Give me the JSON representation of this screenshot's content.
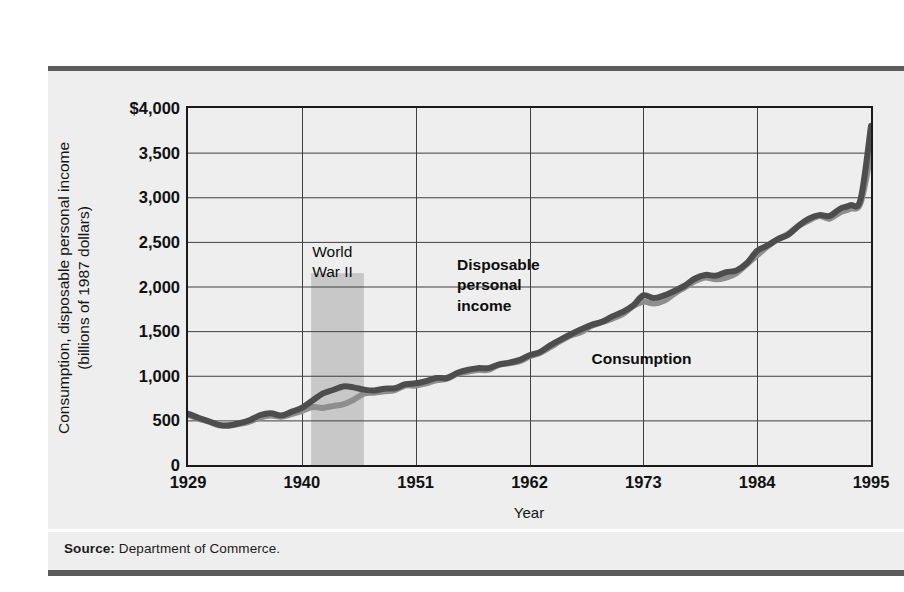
{
  "figure": {
    "source_label": "Source:",
    "source_text": "Department of Commerce."
  },
  "chart_data": {
    "type": "line",
    "title": "",
    "xlabel": "Year",
    "ylabel": "Consumption, disposable personal income (billions of 1987 dollars)",
    "ylabel_line1": "Consumption, disposable personal income",
    "ylabel_line2": "(billions of 1987 dollars)",
    "xlim": [
      1929,
      1995
    ],
    "ylim": [
      0,
      4000
    ],
    "grid": true,
    "legend_position": "inline-annotations",
    "ytick_labels": [
      "$4,000",
      "3,500",
      "3,000",
      "2,500",
      "2,000",
      "1,500",
      "1,000",
      "500",
      "0"
    ],
    "ytick_values": [
      4000,
      3500,
      3000,
      2500,
      2000,
      1500,
      1000,
      500,
      0
    ],
    "xtick_labels": [
      "1929",
      "1940",
      "1951",
      "1962",
      "1973",
      "1984",
      "1995"
    ],
    "xtick_values": [
      1929,
      1940,
      1951,
      1962,
      1973,
      1984,
      1995
    ],
    "annotations": [
      {
        "name": "world-war-ii",
        "text": "World\nWar II",
        "line1": "World",
        "line2": "War II",
        "x": 1941,
        "y": 2500,
        "bold": false
      },
      {
        "name": "disposable-personal-income",
        "text": "Disposable personal income",
        "line1": "Disposable",
        "line2": "personal",
        "line3": "income",
        "x": 1955,
        "y": 2350,
        "bold": true
      },
      {
        "name": "consumption",
        "text": "Consumption",
        "x": 1968,
        "y": 1300,
        "bold": true
      }
    ],
    "shaded_regions": [
      {
        "name": "world-war-ii-band",
        "label": "World War II",
        "x_start": 1940.9,
        "x_end": 1946.0,
        "y_start": 0,
        "y_end": 2150,
        "color": "#c3c3c3"
      }
    ],
    "series": [
      {
        "name": "Disposable personal income",
        "color": "#4d4d4d",
        "width": 6,
        "x": [
          1929,
          1930,
          1931,
          1932,
          1933,
          1934,
          1935,
          1936,
          1937,
          1938,
          1939,
          1940,
          1941,
          1942,
          1943,
          1944,
          1945,
          1946,
          1947,
          1948,
          1949,
          1950,
          1951,
          1952,
          1953,
          1954,
          1955,
          1956,
          1957,
          1958,
          1959,
          1960,
          1961,
          1962,
          1963,
          1964,
          1965,
          1966,
          1967,
          1968,
          1969,
          1970,
          1971,
          1972,
          1973,
          1974,
          1975,
          1976,
          1977,
          1978,
          1979,
          1980,
          1981,
          1982,
          1983,
          1984,
          1985,
          1986,
          1987,
          1988,
          1989,
          1990,
          1991,
          1992,
          1993,
          1994,
          1995
        ],
        "values": [
          575,
          530,
          490,
          450,
          445,
          470,
          505,
          560,
          580,
          555,
          595,
          640,
          720,
          800,
          840,
          880,
          870,
          845,
          835,
          855,
          860,
          905,
          915,
          940,
          975,
          975,
          1030,
          1065,
          1085,
          1085,
          1125,
          1145,
          1175,
          1230,
          1265,
          1340,
          1405,
          1465,
          1520,
          1570,
          1605,
          1665,
          1715,
          1785,
          1900,
          1870,
          1900,
          1950,
          2010,
          2090,
          2130,
          2120,
          2160,
          2180,
          2260,
          2400,
          2460,
          2530,
          2580,
          2680,
          2760,
          2800,
          2790,
          2870,
          2910,
          2980,
          3800
        ]
      },
      {
        "name": "Consumption",
        "color": "#8e8e8e",
        "width": 6,
        "x": [
          1929,
          1930,
          1931,
          1932,
          1933,
          1934,
          1935,
          1936,
          1937,
          1938,
          1939,
          1940,
          1941,
          1942,
          1943,
          1944,
          1945,
          1946,
          1947,
          1948,
          1949,
          1950,
          1951,
          1952,
          1953,
          1954,
          1955,
          1956,
          1957,
          1958,
          1959,
          1960,
          1961,
          1962,
          1963,
          1964,
          1965,
          1966,
          1967,
          1968,
          1969,
          1970,
          1971,
          1972,
          1973,
          1974,
          1975,
          1976,
          1977,
          1978,
          1979,
          1980,
          1981,
          1982,
          1983,
          1984,
          1985,
          1986,
          1987,
          1988,
          1989,
          1990,
          1991,
          1992,
          1993,
          1994,
          1995
        ],
        "values": [
          560,
          520,
          485,
          445,
          440,
          460,
          490,
          535,
          555,
          540,
          570,
          605,
          650,
          640,
          660,
          680,
          730,
          800,
          810,
          825,
          840,
          890,
          890,
          915,
          950,
          965,
          1020,
          1045,
          1065,
          1065,
          1120,
          1140,
          1160,
          1215,
          1255,
          1320,
          1390,
          1450,
          1490,
          1560,
          1600,
          1640,
          1690,
          1780,
          1830,
          1810,
          1840,
          1920,
          1990,
          2060,
          2100,
          2080,
          2100,
          2150,
          2250,
          2350,
          2450,
          2530,
          2590,
          2680,
          2740,
          2790,
          2760,
          2830,
          2870,
          2940,
          3500
        ]
      }
    ]
  }
}
